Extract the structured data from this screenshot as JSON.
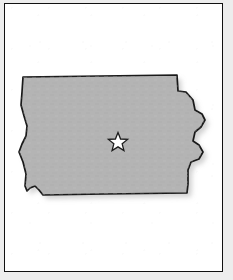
{
  "figure": {
    "kind": "state-outline-map",
    "frame": {
      "border_color": "#111111",
      "background_color": "#ffffff",
      "outer_margin_color": "#ededed"
    }
  },
  "map": {
    "state_name": "Iowa",
    "fill_color": "#b4b4b4",
    "outline_color": "#1a1a1a",
    "shadow_color": "#9a9a9a",
    "state_outline_path": "M 18 73 L 172 71 L 173 87 L 181 88 L 188 96 L 190 106 L 197 110 L 200 116 L 196 123 L 190 128 L 188 137 L 194 141 L 198 148 L 194 155 L 186 158 L 183 166 L 183 180 L 182 189 L 100 190 L 38 191 L 34 186 L 30 182 L 25 184 L 22 187 L 20 182 L 21 170 L 18 158 L 14 148 L 17 140 L 21 132 L 22 122 L 19 112 L 16 101 L 17 88 Z",
    "shadow_offset": {
      "dx": 4,
      "dy": 4
    }
  },
  "capital_marker": {
    "icon": "star-icon",
    "label": "capital-star",
    "fill_color": "#ffffff",
    "outline_color": "#1c1c1c",
    "center": {
      "x": 113,
      "y": 139
    },
    "outer_radius": 10.5,
    "inner_radius": 4.4,
    "star_points_path": "M 113 128.5 L 115.58 135.02 L 122.58 135.42 L 117.15 139.82 L 118.94 146.6 L 113 142.85 L 107.06 146.6 L 108.85 139.82 L 103.42 135.42 L 110.42 135.02 Z"
  }
}
